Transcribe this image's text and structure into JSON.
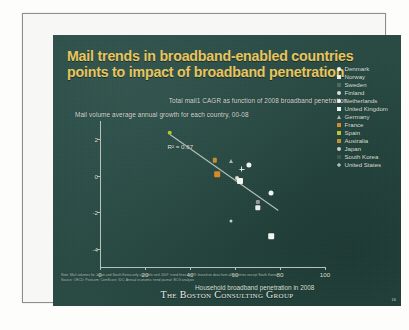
{
  "slide": {
    "title": "Mail trends in broadband-enabled countries points to impact of broadband penetration",
    "subtitle": "Total mail1 CAGR as function of 2008 broadband penetration",
    "chart_note": "Mail volume average annual growth for each country, 00-08",
    "footnote_line1": "Note:  Mail volumes for Japan and South Korea only available until 2007; trend lines and R² based on data from all countries except South Korea",
    "footnote_line2": "Source:  OECD; Postcom; ComScore; IDC; Annual economic trend journal; BCG analysis",
    "logo": "The Boston Consulting Group",
    "page_number": "16",
    "colors": {
      "background": "#284a44",
      "title": "#e9c55c",
      "text": "#dfe3dd",
      "trendline": "#c9d2c9",
      "white_marker": "#f2f4f0",
      "orange_marker": "#d98a28",
      "yellow_green_marker": "#b7c72c",
      "gray_marker": "#aab4ae",
      "page_frame": "#8e8e8e"
    }
  },
  "chart_data": {
    "type": "scatter",
    "title": "Total mail1 CAGR as function of 2008 broadband penetration",
    "subtitle": "Mail volume average annual growth for each country, 00-08",
    "xlabel": "Household broadband penetration in 2008",
    "ylabel": "",
    "xlim": [
      0,
      100
    ],
    "ylim": [
      -5,
      3
    ],
    "xticks": [
      0,
      20,
      40,
      60,
      80,
      100
    ],
    "yticks": [
      2,
      0,
      -2,
      -4
    ],
    "grid": false,
    "legend_position": "right",
    "annotations": [
      {
        "text": "R² = 0.67",
        "x": 30,
        "y": 1.55
      }
    ],
    "trendline": {
      "x0": 31,
      "y0": 2.3,
      "x1": 79,
      "y1": -1.85
    },
    "points": [
      {
        "label": "Denmark",
        "x": 76,
        "y": -0.95,
        "marker": "circle",
        "color": "#f2f4f0",
        "size": 5.0
      },
      {
        "label": "Norway",
        "x": 70,
        "y": -1.75,
        "marker": "square",
        "color": "#e8ece6",
        "size": 5.4
      },
      {
        "label": "Sweden",
        "x": 70,
        "y": -1.45,
        "marker": "square",
        "color": "#8f9a92",
        "size": 4.2
      },
      {
        "label": "Finland",
        "x": 61,
        "y": -0.15,
        "marker": "circle",
        "color": "#d8ddd6",
        "size": 4.0
      },
      {
        "label": "Netherlands",
        "x": 66,
        "y": 0.6,
        "marker": "circle",
        "color": "#f2f4f0",
        "size": 5.2
      },
      {
        "label": "United Kingdom",
        "x": 62,
        "y": -0.3,
        "marker": "square",
        "color": "#f2f4f0",
        "size": 6.0
      },
      {
        "label": "Germany",
        "x": 58,
        "y": 0.8,
        "marker": "triangle",
        "color": "#aab4ae",
        "size": 4.4
      },
      {
        "label": "France",
        "x": 52,
        "y": 0.1,
        "marker": "square",
        "color": "#d98a28",
        "size": 5.6
      },
      {
        "label": "Spain",
        "x": 31,
        "y": 2.35,
        "marker": "circle",
        "color": "#b7c72c",
        "size": 4.6
      },
      {
        "label": "Australia",
        "x": 51,
        "y": 0.85,
        "marker": "square",
        "color": "#c2912f",
        "size": 4.4
      },
      {
        "label": "Japan",
        "x": 58,
        "y": -2.5,
        "marker": "circle",
        "color": "#c7cfc8",
        "size": 3.0
      },
      {
        "label": "South Korea",
        "x": 76,
        "y": -3.3,
        "marker": "square",
        "color": "#f2f4f0",
        "size": 5.6
      },
      {
        "label": "United States",
        "x": 63,
        "y": 0.35,
        "marker": "plus",
        "color": "#dfe6de",
        "size": 5.0
      }
    ],
    "legend": [
      {
        "label": "Denmark",
        "marker": "circle",
        "color": "#f2f4f0"
      },
      {
        "label": "Norway",
        "marker": "square",
        "color": "#e8ece6"
      },
      {
        "label": "Sweden",
        "marker": "square",
        "color": "#4c6a62"
      },
      {
        "label": "Finland",
        "marker": "circle",
        "color": "#d8ddd6"
      },
      {
        "label": "Netherlands",
        "marker": "circle",
        "color": "#f2f4f0"
      },
      {
        "label": "United Kingdom",
        "marker": "square",
        "color": "#f2f4f0"
      },
      {
        "label": "Germany",
        "marker": "triangle",
        "color": "#aab4ae"
      },
      {
        "label": "France",
        "marker": "square",
        "color": "#d98a28"
      },
      {
        "label": "Spain",
        "marker": "square",
        "color": "#b7c72c"
      },
      {
        "label": "Australia",
        "marker": "square",
        "color": "#c2912f"
      },
      {
        "label": "Japan",
        "marker": "circle",
        "color": "#c7cfc8"
      },
      {
        "label": "South Korea",
        "marker": "square",
        "color": "#3b5a52"
      },
      {
        "label": "United States",
        "marker": "plus",
        "color": "#dfe6de"
      }
    ]
  }
}
